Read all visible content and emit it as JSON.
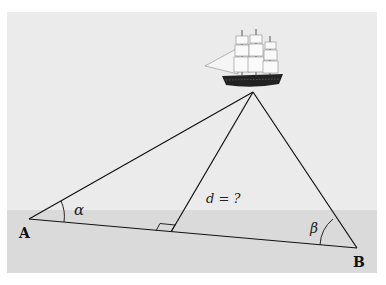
{
  "figure": {
    "sky_color": "#ebebeb",
    "water_color": "#dadada",
    "line_color": "#111111"
  },
  "points": {
    "A": {
      "label": "A",
      "x": 29,
      "y": 219
    },
    "B": {
      "label": "B",
      "x": 357,
      "y": 248
    },
    "S": {
      "x": 253,
      "y": 92
    },
    "F": {
      "x": 171,
      "y": 232
    }
  },
  "labels": {
    "alpha": "α",
    "beta": "β",
    "distance": "d = ?",
    "A": "A",
    "B": "B"
  }
}
